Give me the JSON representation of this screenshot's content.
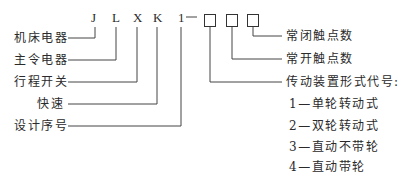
{
  "diagram": {
    "type": "model-code-breakdown",
    "code_letters": [
      "J",
      "L",
      "X",
      "K",
      "1"
    ],
    "dash": "—",
    "placeholder_boxes": 3,
    "left_labels": [
      {
        "text": "机床电器",
        "points_to": "J"
      },
      {
        "text": "主令电器",
        "points_to": "L"
      },
      {
        "text": "行程开关",
        "points_to": "X"
      },
      {
        "text": "快速",
        "points_to": "K"
      },
      {
        "text": "设计序号",
        "points_to": "1"
      }
    ],
    "right_labels": [
      {
        "text": "常闭触点数",
        "points_to": "box3"
      },
      {
        "text": "常开触点数",
        "points_to": "box2"
      },
      {
        "text": "传动装置形式代号:",
        "points_to": "box1"
      }
    ],
    "drive_options": [
      "1—单轮转动式",
      "2—双轮转动式",
      "3—直动不带轮",
      "4—直动带轮"
    ]
  }
}
